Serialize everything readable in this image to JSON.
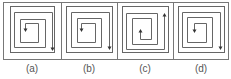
{
  "figure": {
    "frame": {
      "x": 3,
      "y": 2,
      "w": 225,
      "h": 57,
      "stroke": "#777777"
    },
    "dividers_x": [
      61,
      117,
      173
    ],
    "line_color": "#666666",
    "options": [
      {
        "label": "(a)",
        "outer_square": {
          "x": 10,
          "y": 6,
          "w": 44,
          "h": 46
        },
        "path": "M52,49 L52,12 L14,12 L14,47 L45,47 L45,19 L20,19 L20,42 L38,42 L38,23 L25,23 L25,30",
        "arrows": [
          {
            "x": 52,
            "y": 49,
            "dir": "down"
          },
          {
            "x": 25,
            "y": 30,
            "dir": "down"
          }
        ]
      },
      {
        "label": "(b)",
        "outer_square": {
          "x": 66,
          "y": 6,
          "w": 46,
          "h": 46
        },
        "path": "M109,48 L109,12 L71,12 L71,47 L101,47 L101,18 L77,18 L77,42 L95,42 L95,23 L81,23 L81,30",
        "arrows": [
          {
            "x": 109,
            "y": 48,
            "dir": "down"
          },
          {
            "x": 81,
            "y": 30,
            "dir": "down"
          }
        ]
      },
      {
        "label": "(c)",
        "outer_square": {
          "x": 122,
          "y": 6,
          "w": 46,
          "h": 46
        },
        "path": "M164,14 L164,49 L126,49 L126,13 L157,13 L157,44 L132,44 L132,18 L151,18 L151,39 L140,39 L140,30",
        "arrows": [
          {
            "x": 164,
            "y": 14,
            "dir": "up"
          },
          {
            "x": 140,
            "y": 30,
            "dir": "up"
          }
        ]
      },
      {
        "label": "(d)",
        "outer_square": {
          "x": 178,
          "y": 6,
          "w": 46,
          "h": 46
        },
        "path": "M220,48 L220,12 L182,12 L182,47 L212,47 L212,17 L187,17 L187,42 L206,42 L206,23 L194,23 L194,31",
        "arrows": [
          {
            "x": 220,
            "y": 48,
            "dir": "down"
          },
          {
            "x": 194,
            "y": 31,
            "dir": "down"
          }
        ]
      }
    ]
  }
}
